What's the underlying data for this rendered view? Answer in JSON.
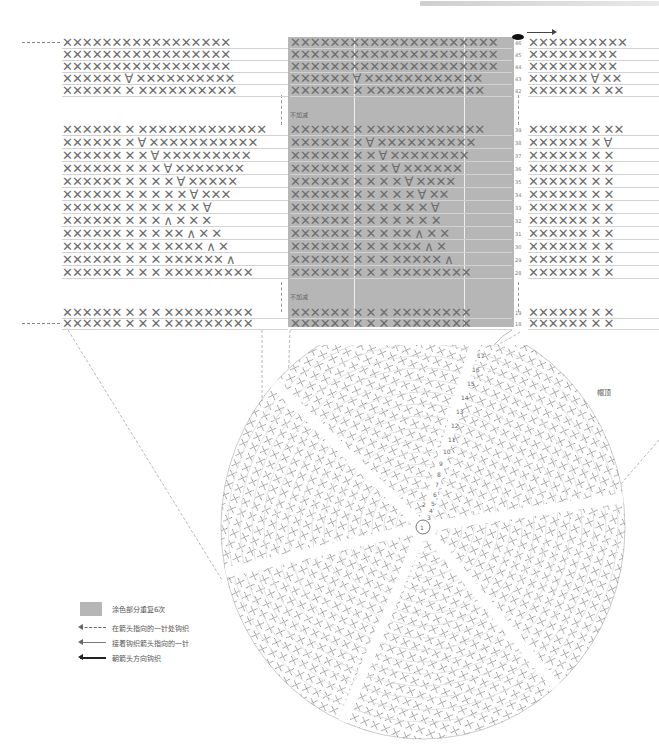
{
  "header": {
    "caption": ""
  },
  "chart": {
    "shaded_note_top": "不加减",
    "shaded_note_bottom": "不加减",
    "top_rows": [
      {
        "num": "46",
        "left": "XXXXXXXXXXXXXXXXX",
        "mid": "XXXXXXXXXXXXXXXXXXXXX",
        "right": "XXXXXXXXXX"
      },
      {
        "num": "45",
        "left": "XXXXXXXXXXXXXXXXX",
        "mid": "XXXXXXXXXXXXXXXXXXXXX",
        "right": "XXXXXXXXX"
      },
      {
        "num": "44",
        "left": "XXXXXXXXXXXXXXXXX",
        "mid": "XXXXXXXXXXXXXXXXXXXXX",
        "right": "XXXXXXXXX"
      },
      {
        "num": "43",
        "left": "XXXXXX V XXXXXXXXXX",
        "mid": "XXXXXX V XXXXXXXXXXXX",
        "right": "XXXXXX V XX"
      },
      {
        "num": "42",
        "left": "XXXXXX X XXXXXXXXXX",
        "mid": "XXXXXX X XXXXXXXXXXXX",
        "right": "XXXXXX X XX"
      }
    ],
    "middle_rows": [
      {
        "num": "39",
        "left": "XXXXXX X XXXXXXXXXXXXX",
        "mid": "XXXXXX X XXXXXXXXXXXX",
        "right": "XXXXXX X XX"
      },
      {
        "num": "38",
        "left": "XXXXXX X V XXXXXXXXXXX",
        "mid": "XXXXXX X V XXXXXXXXXX",
        "right": "XXXXXX X V"
      },
      {
        "num": "37",
        "left": "XXXXXX X X V XXXXXXXXX",
        "mid": "XXXXXX X X V XXXXXXXX",
        "right": "XXXXXX X X"
      },
      {
        "num": "36",
        "left": "XXXXXX X X X V XXXXXXX",
        "mid": "XXXXXX X X X V XXXXXX",
        "right": "XXXXXX X X"
      },
      {
        "num": "35",
        "left": "XXXXXX X X X X V XXXXX",
        "mid": "XXXXXX X X X X V XXXX",
        "right": "XXXXXX X X"
      },
      {
        "num": "34",
        "left": "XXXXXX X X X X X V XXX",
        "mid": "XXXXXX X X X X X V XX",
        "right": "XXXXXX X X"
      },
      {
        "num": "33",
        "left": "XXXXXX X X X X X X V",
        "mid": "XXXXXX X X X X X X V",
        "right": "XXXXXX X X"
      },
      {
        "num": "32",
        "left": "XXXXXX X X X ^ X X X",
        "mid": "XXXXXX X X X X X X X",
        "right": "XXXXXX X X"
      },
      {
        "num": "31",
        "left": "XXXXXX X X X XX ^ X X",
        "mid": "XXXXXX X X X XX ^ X X",
        "right": "XXXXXX X X"
      },
      {
        "num": "30",
        "left": "XXXXXX X X X XXXX ^ X",
        "mid": "XXXXXX X X X XXX ^ X",
        "right": "XXXXXX X X"
      },
      {
        "num": "29",
        "left": "XXXXXX X X X XXXXXX ^",
        "mid": "XXXXXX X X X XXXXX ^",
        "right": "XXXXXX X X"
      },
      {
        "num": "28",
        "left": "XXXXXX X X X XXXXXXXXX",
        "mid": "XXXXXX X X X XXXXXXXX",
        "right": "XXXXXX X X"
      }
    ],
    "bottom_rows": [
      {
        "num": "19",
        "left": "XXXXXX X X X XXXXXXXXX",
        "mid": "XXXXXX X X X XXXXXXXX",
        "right": "XXXXXX X X"
      },
      {
        "num": "18",
        "left": "XXXXXX X X X XXXXXXXXX",
        "mid": "XXXXXX X X X XXXXXXXX",
        "right": "XXXXXX X X"
      }
    ]
  },
  "circle": {
    "label_top": "帽顶",
    "round_numbers": [
      "17",
      "16",
      "15",
      "14",
      "13",
      "12",
      "11",
      "10",
      "9",
      "8",
      "7",
      "6",
      "5",
      "4",
      "3",
      "2",
      "1"
    ],
    "center_label": "①"
  },
  "legend": {
    "items": [
      {
        "type": "swatch",
        "label": "涂色部分重复6次"
      },
      {
        "type": "dashed-arrow",
        "label": "在箭头指向的一针处钩织"
      },
      {
        "type": "thin-arrow",
        "label": "接着钩织箭头指向的一针"
      },
      {
        "type": "thick-arrow",
        "label": "朝箭头方向钩织"
      }
    ]
  },
  "colors": {
    "shade": "#b6b6b6",
    "stitch": "#6d6d6d",
    "line": "#d2d2d2"
  }
}
